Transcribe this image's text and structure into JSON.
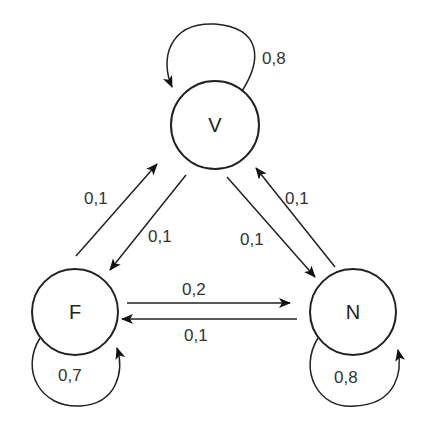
{
  "diagram": {
    "type": "markov-chain-state-diagram",
    "nodes": [
      {
        "id": "V",
        "label": "V"
      },
      {
        "id": "F",
        "label": "F"
      },
      {
        "id": "N",
        "label": "N"
      }
    ],
    "edges": [
      {
        "from": "V",
        "to": "V",
        "label": "0,8"
      },
      {
        "from": "F",
        "to": "V",
        "label": "0,1"
      },
      {
        "from": "V",
        "to": "F",
        "label": "0,1"
      },
      {
        "from": "V",
        "to": "N",
        "label": "0,1"
      },
      {
        "from": "N",
        "to": "V",
        "label": "0,1"
      },
      {
        "from": "F",
        "to": "N",
        "label": "0,2"
      },
      {
        "from": "N",
        "to": "F",
        "label": "0,1"
      },
      {
        "from": "F",
        "to": "F",
        "label": "0,7"
      },
      {
        "from": "N",
        "to": "N",
        "label": "0,8"
      }
    ]
  }
}
